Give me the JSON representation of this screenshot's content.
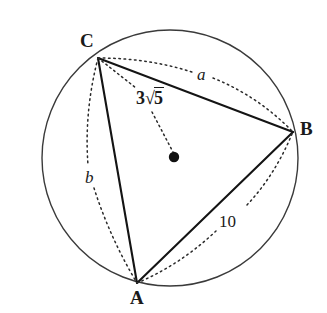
{
  "figure": {
    "background_color": "#ffffff",
    "stroke_color": "#1a1a1a"
  },
  "circle": {
    "name": "circumcircle",
    "center_x": 170,
    "center_y": 158,
    "radius": 128,
    "stroke_color": "#3a3a3a",
    "stroke_width": 1.4
  },
  "center_point": {
    "name": "circle-center-dot",
    "x": 174,
    "y": 157,
    "dot_radius": 5.2,
    "fill": "#111111"
  },
  "vertices": [
    {
      "id": "C",
      "label": "C",
      "x": 98,
      "y": 58
    },
    {
      "id": "B",
      "label": "B",
      "x": 293,
      "y": 132
    },
    {
      "id": "A",
      "label": "A",
      "x": 137,
      "y": 283
    }
  ],
  "solid_sides": [
    {
      "name": "side-CB",
      "from": "C",
      "to": "B"
    },
    {
      "name": "side-CA",
      "from": "C",
      "to": "A"
    },
    {
      "name": "side-AB",
      "from": "A",
      "to": "B"
    }
  ],
  "radius_segment": {
    "name": "radius-C-to-center",
    "from": "C",
    "to": "center",
    "style": "dotted"
  },
  "labels": {
    "vertex_C": "C",
    "vertex_B": "B",
    "vertex_A": "A",
    "side_a": "a",
    "side_b": "b",
    "side_c_value": "10",
    "radius_coefficient": "3",
    "radius_radical": "√",
    "radius_radicand": "5"
  },
  "arcs": [
    {
      "name": "arc-label-a",
      "label": "a",
      "description": "dotted arc from C to B labelled a",
      "style": "dotted"
    },
    {
      "name": "arc-label-b",
      "label": "b",
      "description": "dotted arc from C to A labelled b",
      "style": "dotted"
    },
    {
      "name": "arc-label-10",
      "label": "10",
      "description": "dotted arc from A to B labelled 10",
      "style": "dotted"
    }
  ]
}
